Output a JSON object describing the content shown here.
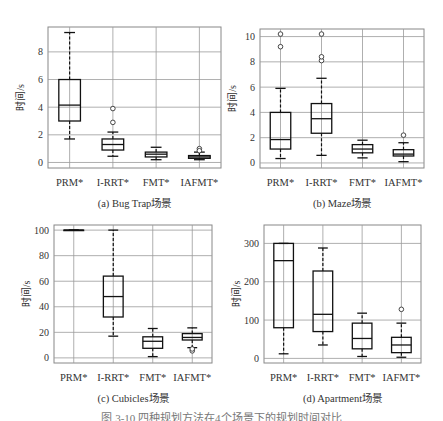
{
  "figure_caption": "图 3-10 四种规划方法在4个场景下的规划时间对比",
  "chart_data": [
    {
      "type": "box",
      "title": "(a) Bug Trap场景",
      "xlabel": "",
      "ylabel": "时间/s",
      "categories": [
        "PRM*",
        "I-RRT*",
        "FMT*",
        "IAFMT*"
      ],
      "ylim": [
        -0.4,
        9.8
      ],
      "yticks": [
        0,
        2,
        4,
        6,
        8
      ],
      "grid": true,
      "frame": {
        "x": 48,
        "y": 27,
        "w": 173,
        "h": 141
      },
      "boxes": [
        {
          "whislo": 1.7,
          "q1": 3.0,
          "med": 4.15,
          "q3": 6.0,
          "whishi": 9.4,
          "fliers": []
        },
        {
          "whislo": 0.45,
          "q1": 0.9,
          "med": 1.3,
          "q3": 1.7,
          "whishi": 2.2,
          "fliers": [
            2.9,
            3.9
          ]
        },
        {
          "whislo": 0.2,
          "q1": 0.4,
          "med": 0.6,
          "q3": 0.75,
          "whishi": 1.1,
          "fliers": []
        },
        {
          "whislo": 0.2,
          "q1": 0.3,
          "med": 0.4,
          "q3": 0.5,
          "whishi": 0.75,
          "fliers": [
            1.0,
            0.85
          ]
        }
      ]
    },
    {
      "type": "box",
      "title": "(b) Maze场景",
      "xlabel": "",
      "ylabel": "时间/s",
      "categories": [
        "PRM*",
        "I-RRT*",
        "FMT*",
        "IAFMT*"
      ],
      "ylim": [
        -0.4,
        10.6
      ],
      "yticks": [
        0,
        2,
        4,
        6,
        8,
        10
      ],
      "grid": true,
      "frame": {
        "x": 260,
        "y": 29,
        "w": 164,
        "h": 139
      },
      "boxes": [
        {
          "whislo": 0.35,
          "q1": 1.1,
          "med": 1.85,
          "q3": 4.0,
          "whishi": 5.9,
          "fliers": [
            9.2,
            10.2
          ]
        },
        {
          "whislo": 0.6,
          "q1": 2.35,
          "med": 3.5,
          "q3": 4.7,
          "whishi": 6.7,
          "fliers": [
            8.1,
            8.4,
            10.2
          ]
        },
        {
          "whislo": 0.4,
          "q1": 0.8,
          "med": 1.1,
          "q3": 1.45,
          "whishi": 1.8,
          "fliers": []
        },
        {
          "whislo": 0.1,
          "q1": 0.55,
          "med": 0.7,
          "q3": 1.05,
          "whishi": 1.6,
          "fliers": [
            2.2
          ]
        }
      ]
    },
    {
      "type": "box",
      "title": "(c) Cubicles场景",
      "xlabel": "",
      "ylabel": "时间/s",
      "categories": [
        "PRM*",
        "I-RRT*",
        "FMT*",
        "IAFMT*"
      ],
      "ylim": [
        -4,
        104
      ],
      "yticks": [
        0,
        20,
        40,
        60,
        80,
        100
      ],
      "grid": true,
      "frame": {
        "x": 54,
        "y": 225,
        "w": 158,
        "h": 138
      },
      "boxes": [
        {
          "whislo": 100,
          "q1": 100,
          "med": 100,
          "q3": 100,
          "whishi": 100,
          "fliers": []
        },
        {
          "whislo": 17,
          "q1": 32,
          "med": 48,
          "q3": 64,
          "whishi": 100,
          "fliers": []
        },
        {
          "whislo": 1,
          "q1": 7.5,
          "med": 13,
          "q3": 16.5,
          "whishi": 23,
          "fliers": []
        },
        {
          "whislo": 8,
          "q1": 14,
          "med": 16,
          "q3": 19,
          "whishi": 23.5,
          "fliers": [
            5.5,
            7
          ]
        }
      ]
    },
    {
      "type": "box",
      "title": "(d) Apartment场景",
      "xlabel": "",
      "ylabel": "时间/s",
      "categories": [
        "PRM*",
        "I-RRT*",
        "FMT*",
        "IAFMT*"
      ],
      "ylim": [
        -12,
        348
      ],
      "yticks": [
        0,
        100,
        200,
        300
      ],
      "grid": true,
      "frame": {
        "x": 264,
        "y": 225,
        "w": 157,
        "h": 138
      },
      "boxes": [
        {
          "whislo": 12,
          "q1": 80,
          "med": 255,
          "q3": 300,
          "whishi": 300,
          "fliers": []
        },
        {
          "whislo": 35,
          "q1": 70,
          "med": 115,
          "q3": 228,
          "whishi": 288,
          "fliers": []
        },
        {
          "whislo": 5,
          "q1": 25,
          "med": 52,
          "q3": 92,
          "whishi": 118,
          "fliers": []
        },
        {
          "whislo": 3,
          "q1": 15,
          "med": 35,
          "q3": 55,
          "whishi": 92,
          "fliers": [
            128
          ]
        }
      ]
    }
  ]
}
